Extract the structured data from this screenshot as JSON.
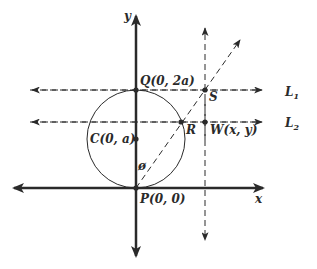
{
  "diagram": {
    "type": "geometry",
    "axes": {
      "x_label": "x",
      "y_label": "y"
    },
    "points": {
      "Q": "Q(0, 2a)",
      "C": "C(0, a)",
      "P": "P(0, 0)",
      "R": "R",
      "S": "S",
      "W": "W(x, y)"
    },
    "angle_label": "ø",
    "lines": {
      "L1": {
        "letter": "L",
        "sub": "1"
      },
      "L2": {
        "letter": "L",
        "sub": "2"
      }
    },
    "colors": {
      "ink": "#2a2a2a",
      "background": "#ffffff"
    }
  }
}
